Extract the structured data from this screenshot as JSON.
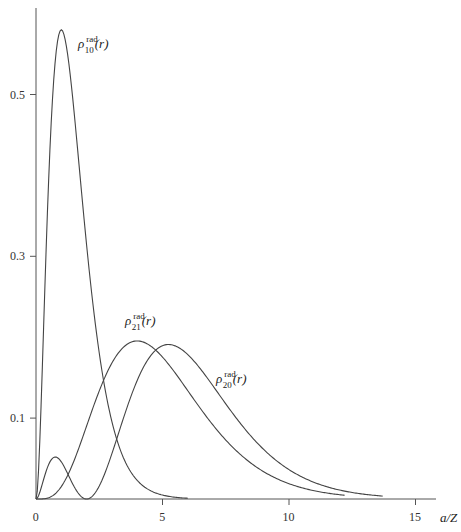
{
  "chart_data": {
    "type": "line",
    "title": "",
    "xlabel": "a/Z",
    "ylabel": "",
    "xlim": [
      0,
      16
    ],
    "ylim": [
      0,
      0.58
    ],
    "grid": false,
    "legend": "inline labels",
    "x_ticks": [
      0,
      5,
      10,
      15
    ],
    "x_tick_labels": [
      "0",
      "5",
      "10",
      "15"
    ],
    "y_ticks": [
      0.1,
      0.3,
      0.5
    ],
    "y_tick_labels": [
      "0.1",
      "0.3",
      "0.5"
    ],
    "series": [
      {
        "name": "ρ_10^rad(r)",
        "label": {
          "rho": "ρ",
          "sup": "rad",
          "sub": "10",
          "arg": "(r)"
        },
        "peak": {
          "x": 1.0,
          "y": 0.58
        },
        "x": [
          0,
          0.25,
          0.5,
          0.75,
          1.0,
          1.25,
          1.5,
          2.0,
          2.5,
          3.0,
          3.5,
          4.0,
          4.5,
          5.0
        ],
        "values": [
          0,
          0.163,
          0.394,
          0.536,
          0.58,
          0.549,
          0.478,
          0.314,
          0.18,
          0.096,
          0.048,
          0.023,
          0.011,
          0.005
        ]
      },
      {
        "name": "ρ_21^rad(r)",
        "label": {
          "rho": "ρ",
          "sup": "rad",
          "sub": "21",
          "arg": "(r)"
        },
        "peak": {
          "x": 4.0,
          "y": 0.195
        },
        "x": [
          0,
          1,
          2,
          3,
          4,
          5,
          6,
          7,
          8,
          9,
          10,
          11,
          12
        ],
        "values": [
          0,
          0.015,
          0.09,
          0.168,
          0.195,
          0.175,
          0.134,
          0.091,
          0.057,
          0.034,
          0.019,
          0.01,
          0.005
        ]
      },
      {
        "name": "ρ_20^rad(r)",
        "label": {
          "rho": "ρ",
          "sup": "rad",
          "sub": "20",
          "arg": "(r)"
        },
        "peak": {
          "x": 5.24,
          "y": 0.191
        },
        "secondary_peak": {
          "x": 0.76,
          "y": 0.052
        },
        "node": 2.0,
        "x": [
          0,
          0.5,
          0.76,
          1.0,
          1.5,
          2.0,
          3,
          4,
          5,
          5.24,
          6,
          7,
          8,
          9,
          10,
          11,
          12,
          13,
          14
        ],
        "values": [
          0,
          0.044,
          0.052,
          0.046,
          0.015,
          0,
          0.056,
          0.147,
          0.189,
          0.191,
          0.179,
          0.141,
          0.1,
          0.067,
          0.045,
          0.028,
          0.017,
          0.01,
          0.006
        ]
      }
    ]
  }
}
